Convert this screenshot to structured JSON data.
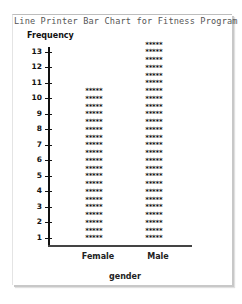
{
  "chart_data": {
    "type": "bar",
    "title": "Line Printer Bar Chart for Fitness Program",
    "xlabel": "gender",
    "ylabel": "Frequency",
    "categories": [
      "Female",
      "Male"
    ],
    "values": [
      10,
      13
    ],
    "ylim": [
      0,
      13
    ],
    "yticks": [
      1,
      2,
      3,
      4,
      5,
      6,
      7,
      8,
      9,
      10,
      11,
      12,
      13
    ],
    "bar_symbol": "*****",
    "rows_per_unit": 2,
    "grid": false,
    "legend": null
  },
  "title_text": "Line Printer Bar Chart for Fitness Program",
  "ylabel_text": "Frequency",
  "xlabel_text": "gender",
  "cat_female": "Female",
  "cat_male": "Male"
}
